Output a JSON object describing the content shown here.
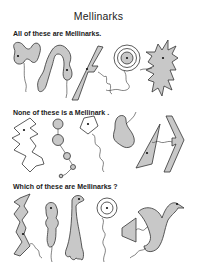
{
  "title": "Mellinarks",
  "sections": [
    {
      "heading": "All of these are Mellinarks.",
      "count": 6
    },
    {
      "heading": "None of these is a Mellinark .",
      "count": 6
    },
    {
      "heading": "Which of these are Mellinarks ?",
      "count": 6
    }
  ],
  "colors": {
    "fill": "#c8c8c8",
    "stroke": "#333333",
    "background": "#ffffff"
  }
}
